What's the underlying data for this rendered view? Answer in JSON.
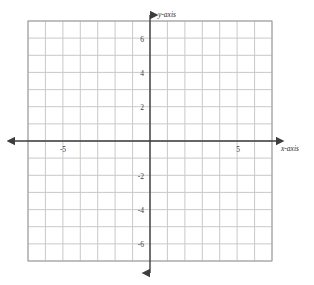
{
  "figure": {
    "kind": "cartesian-coordinate-grid",
    "background_color": "#ffffff",
    "grid_line_color": "#c9c9c9",
    "grid_border_color": "#9a9a9a",
    "axis_color": "#3d3d3d"
  },
  "labels": {
    "y_axis_label": "y-axis",
    "x_axis_label": "x-axis"
  },
  "chart_data": {
    "type": "scatter",
    "title": "",
    "subtitle": "",
    "xlabel": "x-axis",
    "ylabel": "y-axis",
    "xlim": [
      -7,
      7
    ],
    "ylim": [
      -7,
      7
    ],
    "grid": true,
    "grid_step": 1,
    "legend": "none",
    "x_tick_labels": [
      "-5",
      "5"
    ],
    "x_tick_values": [
      -5,
      5
    ],
    "y_tick_labels": [
      "6",
      "4",
      "2",
      "-2",
      "-4",
      "-6"
    ],
    "y_tick_values": [
      6,
      4,
      2,
      -2,
      -4,
      -6
    ],
    "series": [
      {
        "name": "",
        "x": [],
        "y": []
      }
    ],
    "annotations": []
  },
  "ticks": {
    "x": [
      {
        "value": -5,
        "label": "-5"
      },
      {
        "value": 5,
        "label": "5"
      }
    ],
    "y": [
      {
        "value": 6,
        "label": "6"
      },
      {
        "value": 4,
        "label": "4"
      },
      {
        "value": 2,
        "label": "2"
      },
      {
        "value": -2,
        "label": "-2"
      },
      {
        "value": -4,
        "label": "-4"
      },
      {
        "value": -6,
        "label": "-6"
      }
    ]
  }
}
